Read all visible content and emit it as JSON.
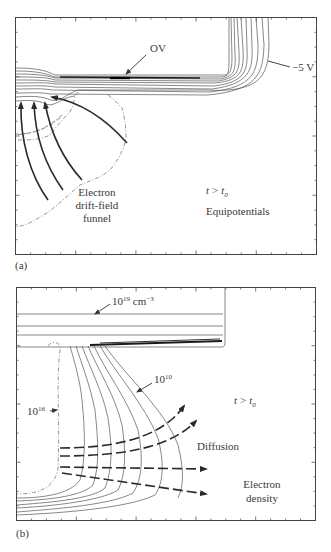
{
  "figure": {
    "panels": [
      {
        "id": "a",
        "panel_label": "(a)",
        "time_label_t": "t",
        "time_label_op": " > ",
        "time_label_t0": "t",
        "time_label_sub": "0",
        "title": "Equipotentials",
        "labels": {
          "zero_volt": "OV",
          "minus_five_volt": "−5 V",
          "funnel_line1": "Electron",
          "funnel_line2": "drift-field",
          "funnel_line3": "funnel"
        }
      },
      {
        "id": "b",
        "panel_label": "(b)",
        "time_label_t": "t",
        "time_label_op": " > ",
        "time_label_t0": "t",
        "time_label_sub": "0",
        "labels": {
          "high_density_base": "10",
          "high_density_exp": "19",
          "high_density_unit": " cm",
          "high_density_unit_exp": "−3",
          "mid_density_base": "10",
          "mid_density_exp": "16",
          "low_density_base": "10",
          "low_density_exp": "10",
          "diffusion": "Diffusion",
          "density_line1": "Electron",
          "density_line2": "density"
        }
      }
    ]
  }
}
